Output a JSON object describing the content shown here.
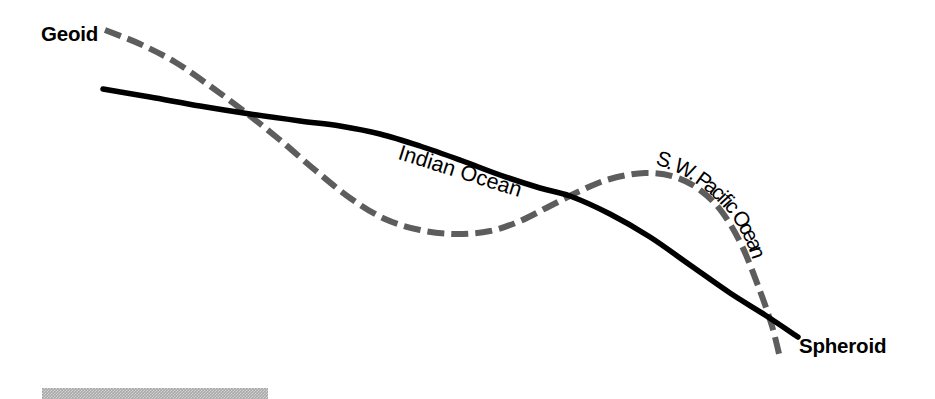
{
  "figure": {
    "width": 935,
    "height": 399,
    "background_color": "#ffffff"
  },
  "labels": {
    "geoid": "Geoid",
    "spheroid": "Spheroid",
    "indian_ocean": "Indian Ocean",
    "sw_pacific_ocean": "S. W. Pacific Ocean"
  },
  "colors": {
    "geoid_line": "#5d5d5d",
    "spheroid_line": "#000000",
    "text": "#000000",
    "bottom_bar": "#a8a8a8",
    "background": "#ffffff"
  },
  "chart_data": {
    "type": "line",
    "xlabel": "",
    "ylabel": "",
    "grid": false,
    "legend_position": "inline-endpoint-labels",
    "annotations": [
      {
        "text": "Geoid",
        "x": 41,
        "y": 34,
        "style": "bold",
        "rotation": 0
      },
      {
        "text": "Spheroid",
        "x": 799,
        "y": 346,
        "style": "bold",
        "rotation": 0
      },
      {
        "text": "Indian Ocean",
        "x": 399,
        "y": 142,
        "style": "regular",
        "rotation": 17.5
      },
      {
        "text": "S. W. Pacific Ocean",
        "x": 620,
        "y": 160,
        "style": "regular-curved",
        "rotation_start": 18,
        "rotation_end": 64
      }
    ],
    "series": [
      {
        "name": "Geoid",
        "style": "dashed",
        "color": "#5d5d5d",
        "stroke_width": 6,
        "dash_pattern": [
          17,
          7
        ],
        "points": [
          [
            105,
            30
          ],
          [
            140,
            44
          ],
          [
            175,
            62
          ],
          [
            210,
            86
          ],
          [
            245,
            112
          ],
          [
            280,
            140
          ],
          [
            315,
            170
          ],
          [
            350,
            198
          ],
          [
            385,
            219
          ],
          [
            420,
            230
          ],
          [
            455,
            234
          ],
          [
            490,
            231
          ],
          [
            520,
            221
          ],
          [
            550,
            206
          ],
          [
            580,
            191
          ],
          [
            610,
            179
          ],
          [
            645,
            173
          ],
          [
            675,
            177
          ],
          [
            700,
            190
          ],
          [
            722,
            212
          ],
          [
            742,
            246
          ],
          [
            760,
            291
          ],
          [
            772,
            326
          ],
          [
            780,
            358
          ]
        ]
      },
      {
        "name": "Spheroid",
        "style": "solid",
        "color": "#000000",
        "stroke_width": 5.5,
        "points": [
          [
            103,
            89
          ],
          [
            150,
            97
          ],
          [
            200,
            106
          ],
          [
            250,
            114
          ],
          [
            300,
            121
          ],
          [
            340,
            126
          ],
          [
            380,
            134
          ],
          [
            420,
            146
          ],
          [
            460,
            160
          ],
          [
            500,
            175
          ],
          [
            540,
            188
          ],
          [
            570,
            196
          ],
          [
            610,
            214
          ],
          [
            650,
            237
          ],
          [
            690,
            265
          ],
          [
            730,
            293
          ],
          [
            765,
            315
          ],
          [
            798,
            337
          ]
        ]
      }
    ],
    "crossings": [
      {
        "x": 340,
        "y": 125
      },
      {
        "x": 570,
        "y": 196
      },
      {
        "x": 766,
        "y": 315
      }
    ]
  },
  "bottom_bar": {
    "present": true,
    "x": 42,
    "y": 388,
    "width": 226,
    "height": 11
  }
}
